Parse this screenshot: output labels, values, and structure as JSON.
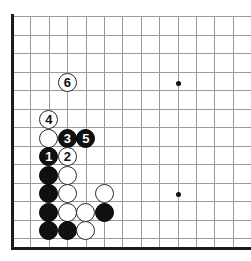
{
  "diagram": {
    "kind": "go-board-diagram",
    "board_size_visible_cols": 13,
    "board_size_visible_rows": 13,
    "background_color": "#ffffff",
    "grid_color": "#9a9a9a",
    "edge_color": "#1a1a1a",
    "black_stone_color": "#101010",
    "white_stone_color": "#ffffff",
    "stone_outline_color": "#2a2a2a",
    "black_number_color": "#ffffff",
    "white_number_color": "#101010"
  },
  "geometry": {
    "origin_x": 12,
    "origin_y": 16,
    "cell_w": 18.4,
    "cell_h": 18.5,
    "stone_diameter": 19,
    "left_edge_x": 11,
    "bottom_edge_y": 247,
    "cols": 13,
    "rows": 13
  },
  "star_points": [
    {
      "name": "star-point-upper-right",
      "col": 9,
      "row": 3.6
    },
    {
      "name": "star-point-lower-right",
      "col": 9,
      "row": 9.6
    }
  ],
  "stones": [
    {
      "name": "white-stone-move-6",
      "color": "white",
      "col": 3,
      "row": 3.6,
      "label": "6"
    },
    {
      "name": "white-stone-move-4",
      "color": "white",
      "col": 2,
      "row": 5.6,
      "label": "4"
    },
    {
      "name": "white-stone-plain-c2r7",
      "color": "white",
      "col": 2,
      "row": 6.6,
      "label": ""
    },
    {
      "name": "black-stone-move-3",
      "color": "black",
      "col": 3,
      "row": 6.6,
      "label": "3"
    },
    {
      "name": "black-stone-move-5",
      "color": "black",
      "col": 4,
      "row": 6.6,
      "label": "5"
    },
    {
      "name": "black-stone-move-1",
      "color": "black",
      "col": 2,
      "row": 7.6,
      "label": "1"
    },
    {
      "name": "white-stone-move-2",
      "color": "white",
      "col": 3,
      "row": 7.6,
      "label": "2"
    },
    {
      "name": "black-stone-plain-c2r9",
      "color": "black",
      "col": 2,
      "row": 8.6,
      "label": ""
    },
    {
      "name": "white-stone-plain-c3r9",
      "color": "white",
      "col": 3,
      "row": 8.6,
      "label": ""
    },
    {
      "name": "black-stone-plain-c2r10",
      "color": "black",
      "col": 2,
      "row": 9.6,
      "label": ""
    },
    {
      "name": "white-stone-plain-c3r10",
      "color": "white",
      "col": 3,
      "row": 9.6,
      "label": ""
    },
    {
      "name": "white-stone-plain-c5r10",
      "color": "white",
      "col": 5,
      "row": 9.6,
      "label": ""
    },
    {
      "name": "black-stone-plain-c2r11",
      "color": "black",
      "col": 2,
      "row": 10.6,
      "label": ""
    },
    {
      "name": "white-stone-plain-c3r11",
      "color": "white",
      "col": 3,
      "row": 10.6,
      "label": ""
    },
    {
      "name": "white-stone-plain-c4r11",
      "color": "white",
      "col": 4,
      "row": 10.6,
      "label": ""
    },
    {
      "name": "black-stone-plain-c5r11",
      "color": "black",
      "col": 5,
      "row": 10.6,
      "label": ""
    },
    {
      "name": "black-stone-plain-c2r12",
      "color": "black",
      "col": 2,
      "row": 11.6,
      "label": ""
    },
    {
      "name": "black-stone-plain-c3r12",
      "color": "black",
      "col": 3,
      "row": 11.6,
      "label": ""
    },
    {
      "name": "white-stone-plain-c4r12",
      "color": "white",
      "col": 4,
      "row": 11.6,
      "label": ""
    }
  ]
}
